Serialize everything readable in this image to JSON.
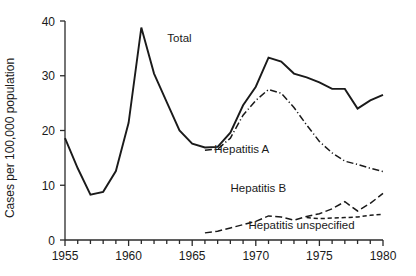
{
  "chart_data": {
    "type": "line",
    "title": "",
    "xlabel": "",
    "ylabel": "Cases per 100,000 population",
    "xlim": [
      1955,
      1980
    ],
    "ylim": [
      0,
      40
    ],
    "yticks": [
      0,
      10,
      20,
      30,
      40
    ],
    "ytick_labels": [
      "0",
      "10",
      "20",
      "30",
      "40"
    ],
    "xticks": [
      1955,
      1960,
      1965,
      1970,
      1975,
      1980
    ],
    "xtick_labels": [
      "1955",
      "1960",
      "1965",
      "1970",
      "1975",
      "1980"
    ],
    "xtick_minor_step": 1,
    "grid": false,
    "legend": "inline-annotations",
    "series": [
      {
        "name": "Total",
        "style": "solid",
        "label_x": 1964.0,
        "label_y": 36.2,
        "x": [
          1955,
          1956,
          1957,
          1958,
          1959,
          1960,
          1961,
          1962,
          1963,
          1964,
          1965,
          1966,
          1967,
          1968,
          1969,
          1970,
          1971,
          1972,
          1973,
          1974,
          1975,
          1976,
          1977,
          1978,
          1979,
          1980
        ],
        "values": [
          18.6,
          13.1,
          8.3,
          8.8,
          12.6,
          21.4,
          38.8,
          30.4,
          25.2,
          20.0,
          17.6,
          16.9,
          17.0,
          19.6,
          24.6,
          28.0,
          33.3,
          32.6,
          30.4,
          29.7,
          28.8,
          27.6,
          27.6,
          24.0,
          25.5,
          26.5
        ]
      },
      {
        "name": "Hepatitis A",
        "style": "dash-dot",
        "label_x": 1968.9,
        "label_y": 15.9,
        "x": [
          1966,
          1967,
          1968,
          1969,
          1970,
          1971,
          1972,
          1973,
          1974,
          1975,
          1976,
          1977,
          1978,
          1979,
          1980
        ],
        "values": [
          16.4,
          16.6,
          18.6,
          22.8,
          25.5,
          27.5,
          26.8,
          24.2,
          21.0,
          18.0,
          15.9,
          14.4,
          13.8,
          13.1,
          12.5
        ]
      },
      {
        "name": "Hepatitis B",
        "style": "long-dash",
        "label_x": 1970.2,
        "label_y": 8.8,
        "x": [
          1966,
          1967,
          1968,
          1969,
          1970,
          1971,
          1972,
          1973,
          1974,
          1975,
          1976,
          1977,
          1978,
          1979,
          1980
        ],
        "values": [
          1.3,
          1.6,
          2.2,
          2.8,
          3.4,
          4.4,
          4.2,
          3.6,
          4.3,
          4.8,
          5.7,
          7.0,
          5.3,
          6.7,
          8.5
        ]
      },
      {
        "name": "Hepatitis unspecified",
        "style": "short-dash",
        "label_x": 1973.6,
        "label_y": 2.0,
        "x": [
          1974,
          1975,
          1976,
          1977,
          1978,
          1979,
          1980
        ],
        "values": [
          4.1,
          3.9,
          4.0,
          4.1,
          4.2,
          4.5,
          4.7
        ]
      }
    ]
  },
  "colors": {
    "ink": "#1a1a1a",
    "axis": "#2a2a2a",
    "background": "#ffffff"
  }
}
